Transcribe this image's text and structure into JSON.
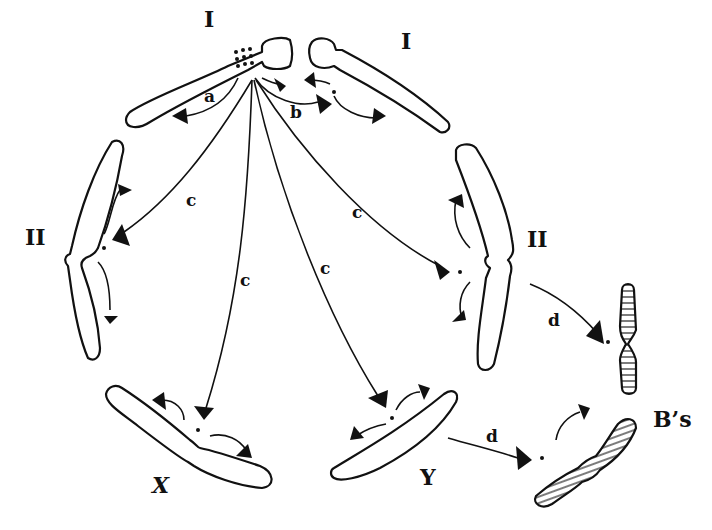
{
  "figure": {
    "chromosome_labels": {
      "I_left": "I",
      "I_right": "I",
      "II_left": "II",
      "II_right": "II",
      "X": "X",
      "Y": "Y",
      "Bs": "B’s"
    },
    "arrow_labels": {
      "a": "a",
      "b": "b",
      "c1": "c",
      "c2": "c",
      "c3": "c",
      "c4": "c",
      "d1": "d",
      "d2": "d"
    },
    "colors": {
      "ink": "#111111",
      "background": "#ffffff"
    }
  }
}
